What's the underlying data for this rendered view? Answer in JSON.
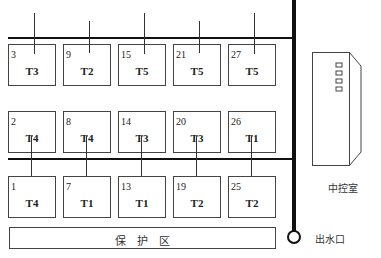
{
  "plots": [
    {
      "id": "3",
      "crop": "T3",
      "row": 0,
      "col": 0
    },
    {
      "id": "9",
      "crop": "T2",
      "row": 0,
      "col": 1
    },
    {
      "id": "15",
      "crop": "T5",
      "row": 0,
      "col": 2
    },
    {
      "id": "21",
      "crop": "T5",
      "row": 0,
      "col": 3
    },
    {
      "id": "27",
      "crop": "T5",
      "row": 0,
      "col": 4
    },
    {
      "id": "2",
      "crop": "T4",
      "row": 1,
      "col": 0
    },
    {
      "id": "8",
      "crop": "T4",
      "row": 1,
      "col": 1
    },
    {
      "id": "14",
      "crop": "T3",
      "row": 1,
      "col": 2
    },
    {
      "id": "20",
      "crop": "T3",
      "row": 1,
      "col": 3
    },
    {
      "id": "26",
      "crop": "T1",
      "row": 1,
      "col": 4
    },
    {
      "id": "1",
      "crop": "T4",
      "row": 2,
      "col": 0
    },
    {
      "id": "7",
      "crop": "T1",
      "row": 2,
      "col": 1
    },
    {
      "id": "13",
      "crop": "T1",
      "row": 2,
      "col": 2
    },
    {
      "id": "19",
      "crop": "T2",
      "row": 2,
      "col": 3
    },
    {
      "id": "25",
      "crop": "T2",
      "row": 2,
      "col": 4
    }
  ],
  "labels": {
    "protection_zone": "保    护    区",
    "control_room": "中控室",
    "water_outlet": "出水口"
  },
  "colors": {
    "line": "#111111",
    "box": "#444444"
  }
}
